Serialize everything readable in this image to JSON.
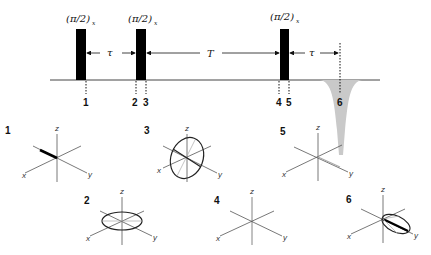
{
  "diagram": {
    "type": "pulse-sequence",
    "title": "",
    "pulses": [
      {
        "label": "(π/2)",
        "subscript": "x",
        "x": 81
      },
      {
        "label": "(π/2)",
        "subscript": "x",
        "x": 141
      },
      {
        "label": "(π/2)",
        "subscript": "x",
        "x": 285
      }
    ],
    "intervals": [
      {
        "label": "τ",
        "from": "pulse1",
        "to": "pulse2"
      },
      {
        "label": "T",
        "from": "pulse2",
        "to": "pulse3"
      },
      {
        "label": "τ",
        "from": "pulse3",
        "to": "echo"
      }
    ],
    "echo": {
      "label": "stimulated echo",
      "color": "#c8c8c8"
    },
    "timepoints": [
      "1",
      "2",
      "3",
      "4",
      "5",
      "6"
    ],
    "panels": [
      {
        "id": "1",
        "axes": [
          "x",
          "y",
          "z"
        ],
        "state": "magnetization vector along -y"
      },
      {
        "id": "2",
        "axes": [
          "x",
          "y",
          "z"
        ],
        "state": "dephased in xy-plane"
      },
      {
        "id": "3",
        "axes": [
          "x",
          "y",
          "z"
        ],
        "state": "rotated into xz-plane"
      },
      {
        "id": "4",
        "axes": [
          "x",
          "y",
          "z"
        ],
        "state": "transverse decayed"
      },
      {
        "id": "5",
        "axes": [
          "x",
          "y",
          "z"
        ],
        "state": "rotated back"
      },
      {
        "id": "6",
        "axes": [
          "x",
          "y",
          "z"
        ],
        "state": "refocused echo along y"
      }
    ]
  }
}
